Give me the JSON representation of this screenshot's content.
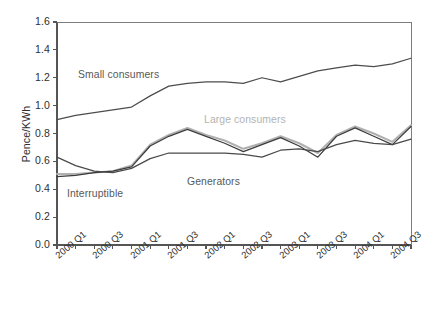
{
  "chart_data": {
    "type": "line",
    "title": "",
    "xlabel": "",
    "ylabel": "Pence/KWh",
    "ylim": [
      0.0,
      1.6
    ],
    "ytick_values": [
      0.0,
      0.2,
      0.4,
      0.6,
      0.8,
      1.0,
      1.2,
      1.4,
      1.6
    ],
    "ytick_labels": [
      "0.0",
      "0.2",
      "0.4",
      "0.6",
      "0.8",
      "1.0",
      "1.2",
      "1.4",
      "1.6"
    ],
    "grid": false,
    "legend_position": "inline-annotations",
    "categories": [
      "2000 Q1",
      "2000 Q2",
      "2000 Q3",
      "2000 Q4",
      "2001 Q1",
      "2001 Q2",
      "2001 Q3",
      "2001 Q4",
      "2002 Q1",
      "2002 Q2",
      "2002 Q3",
      "2002 Q4",
      "2003 Q1",
      "2003 Q2",
      "2003 Q3",
      "2003 Q4",
      "2004 Q1",
      "2004 Q2",
      "2004 Q3",
      "2004 Q4"
    ],
    "xtick_labels_shown": [
      "2000 Q1",
      "2000 Q3",
      "2001 Q1",
      "2001 Q3",
      "2002 Q1",
      "2002 Q3",
      "2003 Q1",
      "2003 Q3",
      "2004 Q1",
      "2004 Q3"
    ],
    "series": [
      {
        "name": "Small consumers",
        "color": "#4d4d4d",
        "values": [
          0.9,
          0.93,
          0.95,
          0.97,
          0.99,
          1.07,
          1.14,
          1.16,
          1.17,
          1.17,
          1.16,
          1.2,
          1.17,
          1.21,
          1.25,
          1.27,
          1.29,
          1.28,
          1.3,
          1.34
        ]
      },
      {
        "name": "Large consumers",
        "color": "#b0b0b0",
        "values": [
          0.51,
          0.51,
          0.52,
          0.53,
          0.57,
          0.72,
          0.79,
          0.84,
          0.79,
          0.75,
          0.69,
          0.73,
          0.78,
          0.73,
          0.66,
          0.79,
          0.85,
          0.8,
          0.74,
          0.86
        ]
      },
      {
        "name": "Generators",
        "color": "#3c3c3c",
        "values": [
          0.49,
          0.5,
          0.52,
          0.53,
          0.56,
          0.71,
          0.78,
          0.83,
          0.78,
          0.73,
          0.67,
          0.72,
          0.77,
          0.71,
          0.63,
          0.78,
          0.84,
          0.78,
          0.72,
          0.85
        ]
      },
      {
        "name": "Interruptible",
        "color": "#4a4a4a",
        "values": [
          0.63,
          0.57,
          0.53,
          0.52,
          0.55,
          0.62,
          0.66,
          0.66,
          0.66,
          0.66,
          0.65,
          0.63,
          0.68,
          0.69,
          0.67,
          0.72,
          0.75,
          0.73,
          0.72,
          0.76
        ]
      }
    ],
    "annotations": [
      {
        "text": "Small consumers",
        "color": "#585858",
        "x_px": 78,
        "y_px": 69
      },
      {
        "text": "Large consumers",
        "color": "#b3b3b3",
        "x_px": 204,
        "y_px": 114
      },
      {
        "text": "Generators",
        "color": "#585858",
        "x_px": 187,
        "y_px": 176
      },
      {
        "text": "Interruptible",
        "color": "#585858",
        "x_px": 67,
        "y_px": 188
      }
    ]
  },
  "axis_colors": {
    "axis_line": "#555555",
    "tick": "#555555"
  }
}
